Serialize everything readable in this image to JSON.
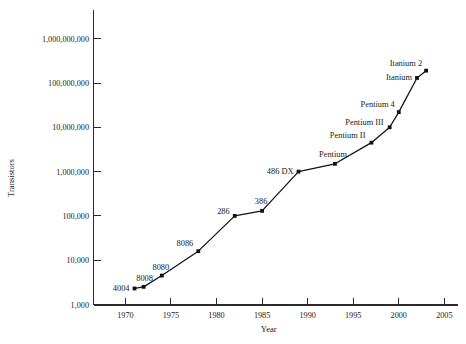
{
  "chart_data": {
    "type": "line",
    "title": "",
    "xlabel": "Year",
    "ylabel": "Transistors",
    "yscale": "log",
    "grid": false,
    "legend": "none",
    "xlim": [
      1966.5,
      2006.5
    ],
    "ylim": [
      1000,
      3000000000
    ],
    "xticks": [
      1970,
      1975,
      1980,
      1985,
      1990,
      1995,
      2000,
      2005
    ],
    "xtick_labels": [
      "1970",
      "1975",
      "1980",
      "1985",
      "1990",
      "1995",
      "2000",
      "2005"
    ],
    "yticks": [
      1000,
      10000,
      100000,
      1000000,
      10000000,
      100000000,
      1000000000
    ],
    "ytick_labels": [
      "1,000",
      "10,000",
      "100,000",
      "1,000,000",
      "10,000,000",
      "100,000,000",
      "1,000,000,000"
    ],
    "series": [
      {
        "name": "Intel processor transistor count",
        "color": "#111111",
        "points": [
          {
            "label": "4004",
            "x": 1971,
            "y": 2300,
            "label_dx": -5,
            "label_dy": 3,
            "anchor": "end"
          },
          {
            "label": "8008",
            "x": 1972,
            "y": 2500,
            "label_dx": 1,
            "label_dy": -6,
            "anchor": "middle"
          },
          {
            "label": "8080",
            "x": 1974,
            "y": 4500,
            "label_dx": -1,
            "label_dy": -6,
            "anchor": "middle"
          },
          {
            "label": "8086",
            "x": 1978,
            "y": 16000,
            "label_dx": -5,
            "label_dy": -5,
            "anchor": "end"
          },
          {
            "label": "286",
            "x": 1982,
            "y": 100000,
            "label_dx": -5,
            "label_dy": -2,
            "anchor": "end"
          },
          {
            "label": "386",
            "x": 1985,
            "y": 130000,
            "label_dx": -1,
            "label_dy": -7,
            "anchor": "middle"
          },
          {
            "label": "486 DX",
            "x": 1989,
            "y": 1000000,
            "label_dx": -5,
            "label_dy": 2,
            "anchor": "end"
          },
          {
            "label": "Pentium",
            "x": 1993,
            "y": 1500000,
            "label_dx": -2,
            "label_dy": -7,
            "anchor": "middle"
          },
          {
            "label": "Pentium II",
            "x": 1997,
            "y": 4500000,
            "label_dx": -6,
            "label_dy": -5,
            "anchor": "end"
          },
          {
            "label": "Pentium III",
            "x": 1999,
            "y": 10000000,
            "label_dx": -6,
            "label_dy": -2,
            "anchor": "end"
          },
          {
            "label": "Pentium 4",
            "x": 2000,
            "y": 22000000,
            "label_dx": -4,
            "label_dy": -5,
            "anchor": "end"
          },
          {
            "label": "Itanium",
            "x": 2002,
            "y": 130000000,
            "label_dx": -5,
            "label_dy": 2,
            "anchor": "end"
          },
          {
            "label": "Itanium 2",
            "x": 2003,
            "y": 190000000,
            "label_dx": -4,
            "label_dy": -5,
            "anchor": "end"
          }
        ]
      }
    ]
  },
  "axes": {
    "x_title": "Year",
    "y_title": "Transistors"
  }
}
